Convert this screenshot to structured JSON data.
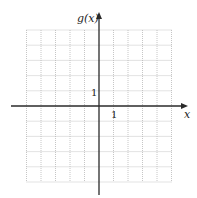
{
  "top_cut_text": "g(x) = ...",
  "graph": {
    "y_axis_label": "g(x)",
    "x_axis_label": "x",
    "y_tick_label": "1",
    "x_tick_label": "1",
    "grid": {
      "x_min": -5,
      "x_max": 5,
      "y_min": -5,
      "y_max": 5,
      "step": 1,
      "style": "dotted"
    },
    "colors": {
      "grid": "#b8b8b8",
      "axis": "#2a2a2a",
      "text": "#222222"
    }
  },
  "chart_data": {
    "type": "grid",
    "title": "",
    "xlabel": "x",
    "ylabel": "g(x)",
    "xlim": [
      -5,
      5
    ],
    "ylim": [
      -5,
      5
    ],
    "x_ticks_labeled": [
      1
    ],
    "y_ticks_labeled": [
      1
    ],
    "grid": true,
    "series": []
  }
}
